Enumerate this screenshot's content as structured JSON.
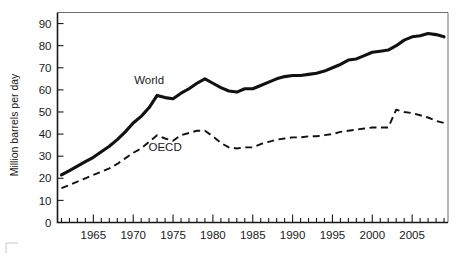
{
  "figure": {
    "background_color": "#ffffff",
    "line_color": "#111111",
    "frame_color": "#6e6e6e"
  },
  "chart_data": {
    "type": "line",
    "title": "",
    "subtitle": "",
    "xlabel": "",
    "ylabel": "Million barrels per day",
    "xlim": [
      1960.5,
      2009.5
    ],
    "ylim": [
      0,
      95
    ],
    "grid": false,
    "legend_position": "inline-annotation",
    "y_ticks": [
      0,
      10,
      20,
      30,
      40,
      50,
      60,
      70,
      80,
      90
    ],
    "y_tick_labels": [
      "0",
      "10",
      "20",
      "30",
      "40",
      "50",
      "60",
      "70",
      "80",
      "90"
    ],
    "x_ticks": [
      1965,
      1970,
      1975,
      1980,
      1985,
      1990,
      1995,
      2000,
      2005
    ],
    "x_tick_labels": [
      "1965",
      "1970",
      "1975",
      "1980",
      "1985",
      "1990",
      "1995",
      "2000",
      "2005"
    ],
    "x_minor_tick_interval": 1,
    "annotations": [
      {
        "text": "World",
        "x": 1972.0,
        "y": 62.5
      },
      {
        "text": "OECD",
        "x": 1974.0,
        "y": 32.5
      }
    ],
    "x": [
      1961,
      1962,
      1963,
      1964,
      1965,
      1966,
      1967,
      1968,
      1969,
      1970,
      1971,
      1972,
      1973,
      1974,
      1975,
      1976,
      1977,
      1978,
      1979,
      1980,
      1981,
      1982,
      1983,
      1984,
      1985,
      1986,
      1987,
      1988,
      1989,
      1990,
      1991,
      1992,
      1993,
      1994,
      1995,
      1996,
      1997,
      1998,
      1999,
      2000,
      2001,
      2002,
      2003,
      2004,
      2005,
      2006,
      2007,
      2008,
      2009
    ],
    "series": [
      {
        "name": "World",
        "style": "solid",
        "values": [
          21.5,
          23.5,
          25.5,
          27.5,
          29.5,
          32.0,
          34.5,
          37.5,
          41.0,
          45.0,
          48.0,
          52.0,
          57.5,
          56.5,
          56.0,
          58.5,
          60.5,
          63.0,
          65.0,
          63.0,
          61.0,
          59.5,
          59.0,
          60.5,
          60.5,
          62.0,
          63.5,
          65.0,
          66.0,
          66.5,
          66.5,
          67.0,
          67.5,
          68.5,
          70.0,
          71.5,
          73.5,
          74.0,
          75.5,
          77.0,
          77.5,
          78.0,
          80.0,
          82.5,
          84.0,
          84.5,
          85.5,
          85.0,
          84.0
        ]
      },
      {
        "name": "OECD",
        "style": "dashed",
        "values": [
          15.5,
          17.0,
          18.5,
          20.0,
          21.5,
          23.0,
          24.5,
          26.5,
          29.0,
          31.5,
          33.5,
          36.5,
          39.5,
          38.0,
          37.0,
          39.5,
          40.5,
          41.5,
          41.5,
          39.0,
          36.0,
          34.0,
          33.5,
          34.0,
          34.0,
          35.5,
          36.5,
          37.5,
          38.0,
          38.5,
          38.5,
          39.0,
          39.0,
          39.5,
          40.0,
          41.0,
          41.5,
          42.0,
          42.5,
          43.0,
          43.0,
          43.0,
          51.0,
          50.0,
          49.5,
          48.5,
          47.5,
          46.0,
          45.0
        ]
      }
    ]
  }
}
